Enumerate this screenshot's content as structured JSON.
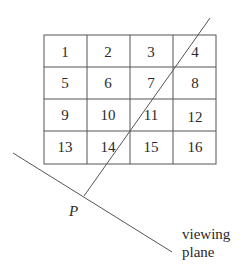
{
  "grid": {
    "rows": 4,
    "cols": 4,
    "cells": [
      "1",
      "2",
      "3",
      "4",
      "5",
      "6",
      "7",
      "8",
      "9",
      "10",
      "11",
      "12",
      "13",
      "14",
      "15",
      "16"
    ]
  },
  "labels": {
    "point": "P",
    "plane_line1": "viewing",
    "plane_line2": "plane"
  },
  "colors": {
    "stroke": "#555555",
    "text": "#2a2a2a",
    "background": "#ffffff"
  }
}
